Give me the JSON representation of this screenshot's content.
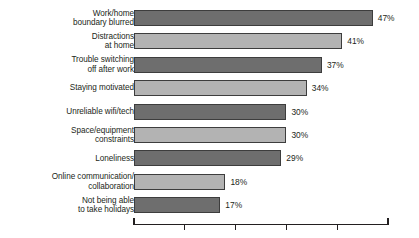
{
  "chart_data": {
    "type": "bar",
    "orientation": "horizontal",
    "title": "",
    "subtitle": "",
    "xlabel": "",
    "ylabel": "",
    "xlim": [
      0,
      50
    ],
    "grid": false,
    "legend": null,
    "value_suffix": "%",
    "axis": {
      "ticks": [
        0,
        10,
        20,
        30,
        40,
        50
      ],
      "tick_labels": [
        "",
        "",
        "",
        "",
        "",
        ""
      ],
      "show_tick_labels": false
    },
    "colors": {
      "bar_dark": "#6e6e6e",
      "bar_light": "#b3b3b3",
      "bar_outline": "#3d3d3d",
      "text": "#231f20",
      "background": "#ffffff"
    },
    "categories": [
      "Work/home\nboundary blurred",
      "Distractions\nat home",
      "Trouble switching\noff after work",
      "Staying motivated",
      "Unreliable wifi/tech",
      "Space/equipment\nconstraints",
      "Loneliness",
      "Online communication/\ncollaboration",
      "Not being able\nto take holidays"
    ],
    "values": [
      47,
      41,
      37,
      34,
      30,
      30,
      29,
      18,
      17
    ],
    "value_labels": [
      "47%",
      "41%",
      "37%",
      "34%",
      "30%",
      "30%",
      "29%",
      "18%",
      "17%"
    ],
    "bar_shades": [
      "dark",
      "light",
      "dark",
      "light",
      "dark",
      "light",
      "dark",
      "light",
      "dark"
    ]
  }
}
